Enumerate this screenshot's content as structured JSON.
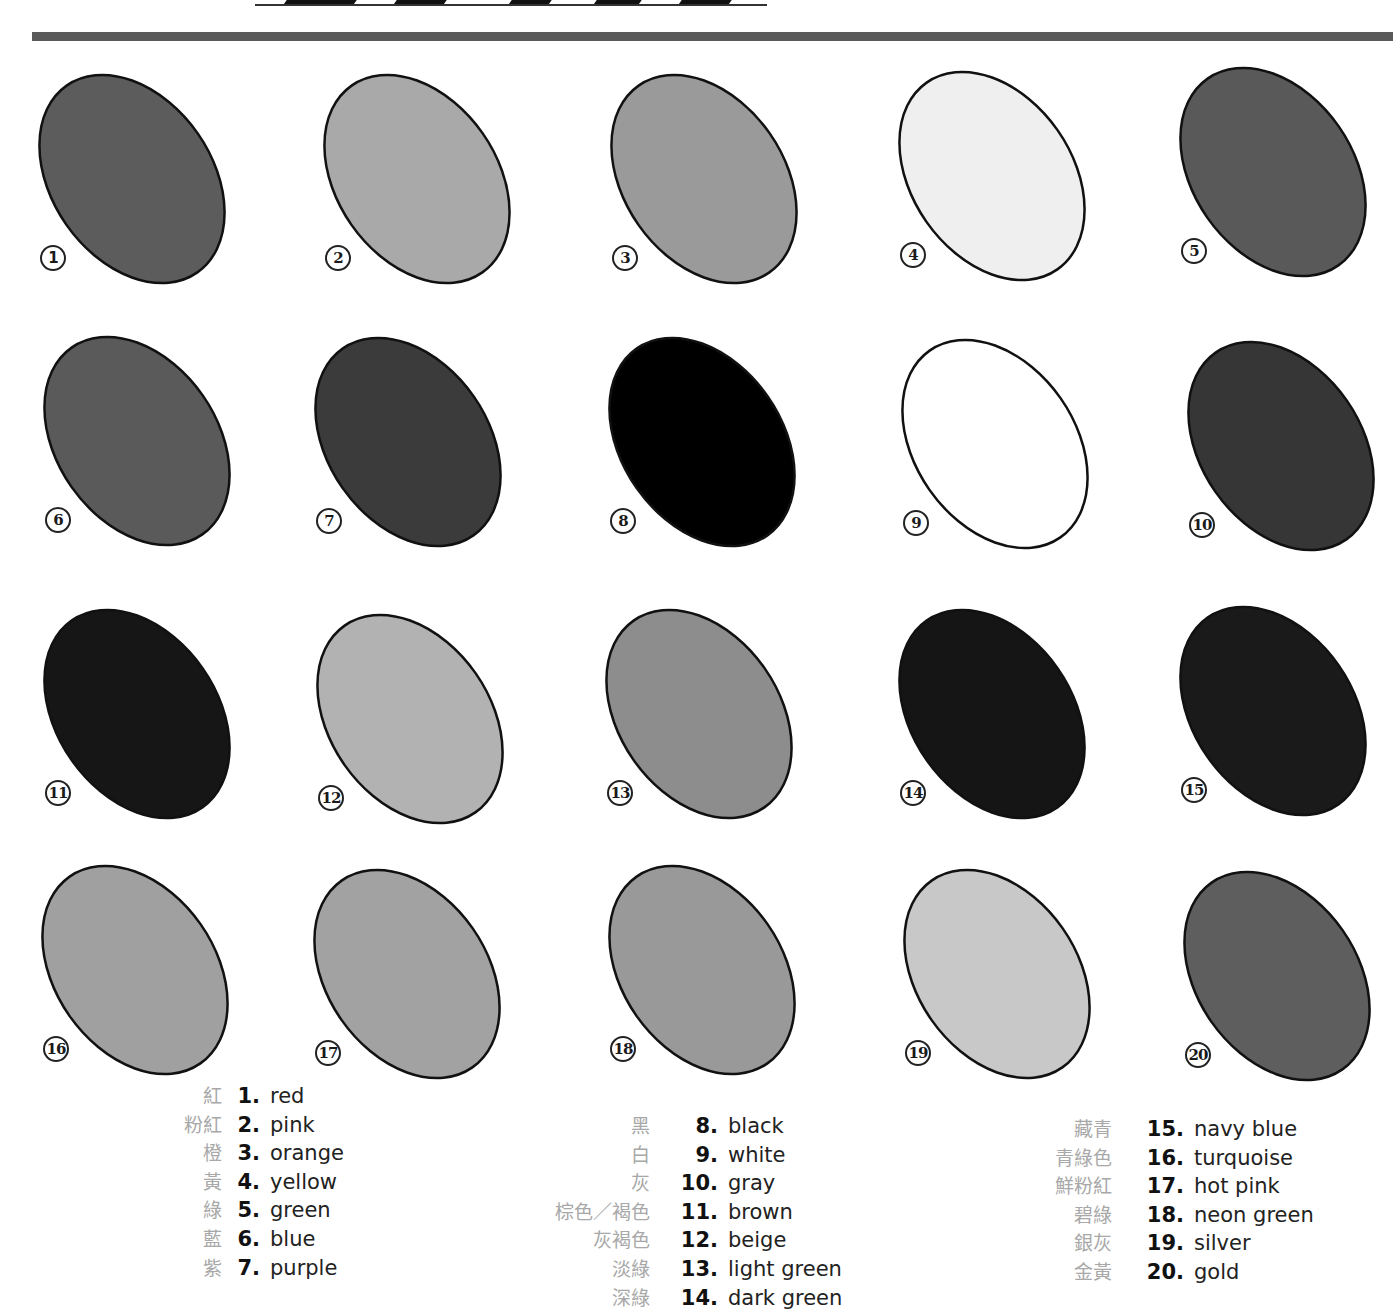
{
  "swatches": [
    {
      "num": "1",
      "name": "red",
      "chinese": "紅",
      "fill": "#5c5c5c",
      "x": 40,
      "y": 75,
      "badge_font": "sans"
    },
    {
      "num": "2",
      "name": "pink",
      "chinese": "粉紅",
      "fill": "#a9a9a9",
      "x": 325,
      "y": 75,
      "badge_font": "serif"
    },
    {
      "num": "3",
      "name": "orange",
      "chinese": "橙",
      "fill": "#9a9a9a",
      "x": 612,
      "y": 75,
      "badge_font": "serif"
    },
    {
      "num": "4",
      "name": "yellow",
      "chinese": "黃",
      "fill": "#efefef",
      "x": 900,
      "y": 72,
      "badge_font": "serif"
    },
    {
      "num": "5",
      "name": "green",
      "chinese": "綠",
      "fill": "#595959",
      "x": 1181,
      "y": 68,
      "badge_font": "serif"
    },
    {
      "num": "6",
      "name": "blue",
      "chinese": "藍",
      "fill": "#5a5a5a",
      "x": 45,
      "y": 337,
      "badge_font": "serif"
    },
    {
      "num": "7",
      "name": "purple",
      "chinese": "紫",
      "fill": "#3b3b3b",
      "x": 316,
      "y": 338,
      "badge_font": "serif"
    },
    {
      "num": "8",
      "name": "black",
      "chinese": "黑",
      "fill": "#000000",
      "x": 610,
      "y": 338,
      "badge_font": "serif"
    },
    {
      "num": "9",
      "name": "white",
      "chinese": "白",
      "fill": "#ffffff",
      "x": 903,
      "y": 340,
      "badge_font": "serif"
    },
    {
      "num": "10",
      "name": "gray",
      "chinese": "灰",
      "fill": "#363636",
      "x": 1189,
      "y": 342,
      "badge_font": "serif"
    },
    {
      "num": "11",
      "name": "brown",
      "chinese": "棕色／褐色",
      "fill": "#161616",
      "x": 45,
      "y": 610,
      "badge_font": "serif"
    },
    {
      "num": "12",
      "name": "beige",
      "chinese": "灰褐色",
      "fill": "#b2b2b2",
      "x": 318,
      "y": 615,
      "badge_font": "serif"
    },
    {
      "num": "13",
      "name": "light green",
      "chinese": "淡綠",
      "fill": "#8d8d8d",
      "x": 607,
      "y": 610,
      "badge_font": "serif"
    },
    {
      "num": "14",
      "name": "dark green",
      "chinese": "深綠",
      "fill": "#151515",
      "x": 900,
      "y": 610,
      "badge_font": "serif"
    },
    {
      "num": "15",
      "name": "navy blue",
      "chinese": "藏青",
      "fill": "#1a1a1a",
      "x": 1181,
      "y": 607,
      "badge_font": "serif"
    },
    {
      "num": "16",
      "name": "turquoise",
      "chinese": "青綠色",
      "fill": "#a0a0a0",
      "x": 43,
      "y": 866,
      "badge_font": "serif"
    },
    {
      "num": "17",
      "name": "hot pink",
      "chinese": "鮮粉紅",
      "fill": "#a2a2a2",
      "x": 315,
      "y": 870,
      "badge_font": "serif"
    },
    {
      "num": "18",
      "name": "neon green",
      "chinese": "碧綠",
      "fill": "#999999",
      "x": 610,
      "y": 866,
      "badge_font": "serif"
    },
    {
      "num": "19",
      "name": "silver",
      "chinese": "銀灰",
      "fill": "#c8c8c8",
      "x": 905,
      "y": 870,
      "badge_font": "serif"
    },
    {
      "num": "20",
      "name": "gold",
      "chinese": "金黃",
      "fill": "#5e5e5e",
      "x": 1185,
      "y": 872,
      "badge_font": "serif"
    }
  ],
  "legend": [
    {
      "x": 234,
      "y": 1082,
      "num_width": 26,
      "items": [
        {
          "cjk": "紅",
          "num": "1.",
          "label": "red"
        },
        {
          "cjk": "粉紅",
          "num": "2.",
          "label": "pink"
        },
        {
          "cjk": "橙",
          "num": "3.",
          "label": "orange"
        },
        {
          "cjk": "黃",
          "num": "4.",
          "label": "yellow"
        },
        {
          "cjk": "綠",
          "num": "5.",
          "label": "green"
        },
        {
          "cjk": "藍",
          "num": "6.",
          "label": "blue"
        },
        {
          "cjk": "紫",
          "num": "7.",
          "label": "purple"
        }
      ]
    },
    {
      "x": 662,
      "y": 1112,
      "num_width": 56,
      "items": [
        {
          "cjk": "黑",
          "num": "8.",
          "label": "black"
        },
        {
          "cjk": "白",
          "num": "9.",
          "label": "white"
        },
        {
          "cjk": "灰",
          "num": "10.",
          "label": "gray"
        },
        {
          "cjk": "棕色／褐色",
          "num": "11.",
          "label": "brown"
        },
        {
          "cjk": "灰褐色",
          "num": "12.",
          "label": "beige"
        },
        {
          "cjk": "淡綠",
          "num": "13.",
          "label": "light green"
        },
        {
          "cjk": "深綠",
          "num": "14.",
          "label": "dark green"
        }
      ]
    },
    {
      "x": 1124,
      "y": 1115,
      "num_width": 60,
      "items": [
        {
          "cjk": "藏青",
          "num": "15.",
          "label": "navy blue"
        },
        {
          "cjk": "青綠色",
          "num": "16.",
          "label": "turquoise"
        },
        {
          "cjk": "鮮粉紅",
          "num": "17.",
          "label": "hot pink"
        },
        {
          "cjk": "碧綠",
          "num": "18.",
          "label": "neon green"
        },
        {
          "cjk": "銀灰",
          "num": "19.",
          "label": "silver"
        },
        {
          "cjk": "金黃",
          "num": "20.",
          "label": "gold"
        }
      ]
    }
  ],
  "colors": {
    "separator": "#5a5a5a",
    "outline": "#111111",
    "cjk_text": "#a8a8a8"
  }
}
